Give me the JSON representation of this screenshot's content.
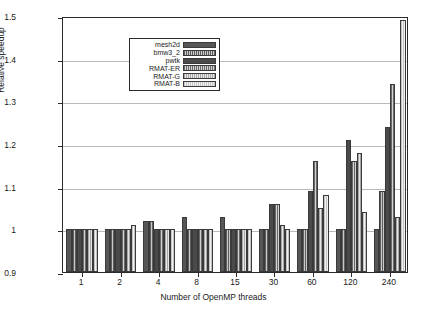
{
  "chart_data": {
    "type": "bar",
    "title": "",
    "xlabel": "Number of OpenMP threads",
    "ylabel": "Relative speedup",
    "ylim": [
      0.9,
      1.5
    ],
    "yticks": [
      "0.9",
      "1",
      "1.1",
      "1.2",
      "1.3",
      "1.4",
      "1.5"
    ],
    "ytick_values": [
      0.9,
      1.0,
      1.1,
      1.2,
      1.3,
      1.4,
      1.5
    ],
    "grid": true,
    "legend_position": "upper left",
    "categories": [
      "1",
      "2",
      "4",
      "8",
      "15",
      "30",
      "60",
      "120",
      "240"
    ],
    "series": [
      {
        "name": "mesh2d",
        "values": [
          1.0,
          1.0,
          1.02,
          1.03,
          1.03,
          1.0,
          1.0,
          1.0,
          1.0
        ]
      },
      {
        "name": "bmw3_2",
        "values": [
          1.0,
          1.0,
          1.02,
          1.0,
          1.0,
          1.0,
          1.0,
          1.0,
          1.09
        ]
      },
      {
        "name": "pwtk",
        "values": [
          1.0,
          1.0,
          1.0,
          1.0,
          1.0,
          1.06,
          1.09,
          1.21,
          1.24
        ]
      },
      {
        "name": "RMAT-ER",
        "values": [
          1.0,
          1.0,
          1.0,
          1.0,
          1.0,
          1.06,
          1.16,
          1.16,
          1.34
        ]
      },
      {
        "name": "RMAT-G",
        "values": [
          1.0,
          1.0,
          1.0,
          1.0,
          1.0,
          1.01,
          1.05,
          1.18,
          1.03
        ]
      },
      {
        "name": "RMAT-B",
        "values": [
          1.0,
          1.01,
          1.0,
          1.0,
          1.0,
          1.0,
          1.08,
          1.04,
          1.49
        ]
      }
    ]
  },
  "legend": {
    "items": [
      {
        "label": "mesh2d"
      },
      {
        "label": "bmw3_2"
      },
      {
        "label": "pwtk"
      },
      {
        "label": "RMAT-ER"
      },
      {
        "label": "RMAT-G"
      },
      {
        "label": "RMAT-B"
      }
    ]
  }
}
